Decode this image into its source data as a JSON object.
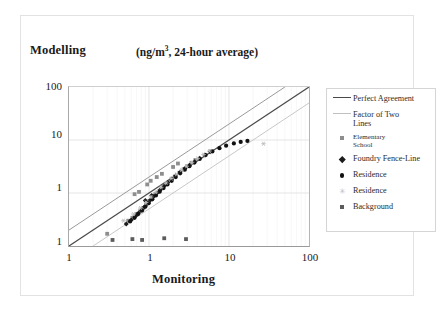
{
  "chart_data": {
    "type": "scatter",
    "title": "",
    "subtitle": "(ng/m3, 24-hour average)",
    "subtitle_prefix": "(ng/m",
    "subtitle_sup": "3",
    "subtitle_suffix": ", 24-hour average)",
    "xlabel": "Monitoring",
    "ylabel": "Modelling",
    "xscale": "log",
    "yscale": "log",
    "xlim": [
      0.1,
      100
    ],
    "ylim": [
      0.1,
      100
    ],
    "xticks": [
      "1",
      "1",
      "10",
      "100"
    ],
    "xtick_values": [
      0.1,
      1,
      10,
      100
    ],
    "yticks": [
      "100",
      "10",
      "1",
      "1"
    ],
    "ytick_values": [
      100,
      10,
      1,
      0.1
    ],
    "grid": true,
    "grid_minor": true,
    "legend_position": "right-outside",
    "reference_lines": [
      {
        "name": "Perfect Agreement",
        "slope": 1,
        "ratio": 1,
        "color": "#4a4a4a",
        "width": 1.2
      },
      {
        "name": "Factor of Two Upper",
        "slope": 1,
        "ratio": 2,
        "color": "#9a9a9a",
        "width": 1.0
      },
      {
        "name": "Factor of Two Lower",
        "slope": 1,
        "ratio": 0.5,
        "color": "#c8c8c8",
        "width": 1.0
      }
    ],
    "series": [
      {
        "name": "Elementary School",
        "marker": "square",
        "color": "#8e8e8e",
        "points": [
          [
            0.3,
            0.17
          ],
          [
            0.55,
            0.3
          ],
          [
            0.62,
            0.34
          ],
          [
            0.7,
            0.4
          ],
          [
            0.78,
            0.46
          ],
          [
            0.85,
            0.52
          ],
          [
            0.92,
            0.6
          ],
          [
            1.0,
            0.7
          ],
          [
            1.1,
            0.82
          ],
          [
            1.2,
            0.95
          ],
          [
            1.35,
            1.1
          ],
          [
            1.5,
            1.3
          ],
          [
            1.7,
            1.55
          ],
          [
            1.9,
            1.8
          ],
          [
            2.1,
            2.05
          ],
          [
            2.4,
            2.4
          ],
          [
            2.7,
            2.8
          ],
          [
            3.0,
            3.2
          ],
          [
            3.4,
            3.7
          ],
          [
            3.8,
            4.2
          ],
          [
            1.05,
            1.7
          ],
          [
            1.25,
            2.0
          ],
          [
            1.45,
            2.3
          ],
          [
            0.95,
            1.45
          ],
          [
            2.0,
            3.1
          ],
          [
            2.3,
            3.6
          ],
          [
            0.66,
            0.95
          ],
          [
            0.75,
            1.05
          ]
        ]
      },
      {
        "name": "Foundry Fence-Line",
        "marker": "diamond",
        "color": "#1c1c1c",
        "points": [
          [
            0.52,
            0.26
          ],
          [
            0.6,
            0.31
          ],
          [
            0.68,
            0.37
          ],
          [
            0.74,
            0.42
          ],
          [
            0.8,
            0.48
          ],
          [
            0.88,
            0.55
          ],
          [
            0.96,
            0.64
          ],
          [
            1.04,
            0.74
          ],
          [
            1.14,
            0.86
          ],
          [
            1.26,
            1.0
          ],
          [
            1.4,
            1.16
          ],
          [
            1.55,
            1.36
          ],
          [
            1.72,
            1.58
          ],
          [
            1.92,
            1.84
          ],
          [
            2.15,
            2.12
          ],
          [
            2.45,
            2.48
          ],
          [
            2.8,
            2.9
          ],
          [
            3.2,
            3.35
          ],
          [
            3.7,
            3.9
          ],
          [
            4.3,
            4.55
          ],
          [
            5.0,
            5.2
          ],
          [
            5.8,
            6.0
          ],
          [
            0.9,
            0.72
          ],
          [
            1.08,
            0.9
          ]
        ]
      },
      {
        "name": "Residence",
        "marker": "circle",
        "color": "#111111",
        "points": [
          [
            0.58,
            0.29
          ],
          [
            0.66,
            0.34
          ],
          [
            0.73,
            0.4
          ],
          [
            0.82,
            0.47
          ],
          [
            0.9,
            0.55
          ],
          [
            0.99,
            0.64
          ],
          [
            1.1,
            0.76
          ],
          [
            1.22,
            0.9
          ],
          [
            1.36,
            1.06
          ],
          [
            1.52,
            1.24
          ],
          [
            1.7,
            1.45
          ],
          [
            1.92,
            1.7
          ],
          [
            2.16,
            2.0
          ],
          [
            2.45,
            2.35
          ],
          [
            2.8,
            2.75
          ],
          [
            3.2,
            3.2
          ],
          [
            3.7,
            3.75
          ],
          [
            4.3,
            4.4
          ],
          [
            5.1,
            5.2
          ],
          [
            6.2,
            6.1
          ],
          [
            7.6,
            7.0
          ],
          [
            9.2,
            7.8
          ],
          [
            11.5,
            8.6
          ],
          [
            14.0,
            9.2
          ],
          [
            17.0,
            9.6
          ]
        ]
      },
      {
        "name": "Residence",
        "marker": "asterisk",
        "color": "#bdbdbd",
        "points": [
          [
            0.48,
            0.3
          ],
          [
            0.64,
            0.4
          ],
          [
            0.78,
            0.52
          ],
          [
            0.92,
            0.66
          ],
          [
            1.06,
            0.84
          ],
          [
            1.22,
            1.04
          ],
          [
            1.42,
            1.28
          ],
          [
            1.64,
            1.55
          ],
          [
            1.9,
            1.88
          ],
          [
            2.2,
            2.25
          ],
          [
            2.55,
            2.7
          ],
          [
            2.95,
            3.2
          ],
          [
            3.45,
            3.8
          ],
          [
            4.05,
            4.5
          ],
          [
            4.8,
            5.3
          ],
          [
            5.7,
            6.2
          ],
          [
            27.0,
            8.5
          ]
        ]
      },
      {
        "name": "Background",
        "marker": "square-dark",
        "color": "#5c5c5c",
        "points": [
          [
            0.82,
            0.13
          ],
          [
            1.55,
            0.14
          ],
          [
            0.35,
            0.13
          ],
          [
            2.9,
            0.135
          ],
          [
            0.62,
            0.135
          ]
        ]
      }
    ],
    "legend": [
      {
        "label": "Perfect Agreement",
        "key": "line",
        "color": "#4a4a4a",
        "multiline": false
      },
      {
        "label": "Factor of Two\nLines",
        "key": "line-light",
        "color": "#c0c0c0",
        "multiline": true
      },
      {
        "label": "Elementary\nSchool",
        "key": "square",
        "color": "#8e8e8e",
        "multiline": true,
        "small": true
      },
      {
        "label": "Foundry Fence-Line",
        "key": "diamond",
        "color": "#1c1c1c",
        "multiline": false
      },
      {
        "label": "Residence",
        "key": "circle",
        "color": "#111111",
        "multiline": false
      },
      {
        "label": "Residence",
        "key": "asterisk",
        "color": "#bdbdbd",
        "multiline": false
      },
      {
        "label": "Background",
        "key": "square-dark",
        "color": "#5c5c5c",
        "multiline": false
      }
    ]
  },
  "axes": {
    "y_title": "Modelling",
    "x_title": "Monitoring",
    "units": "(ng/m3, 24-hour average)"
  }
}
